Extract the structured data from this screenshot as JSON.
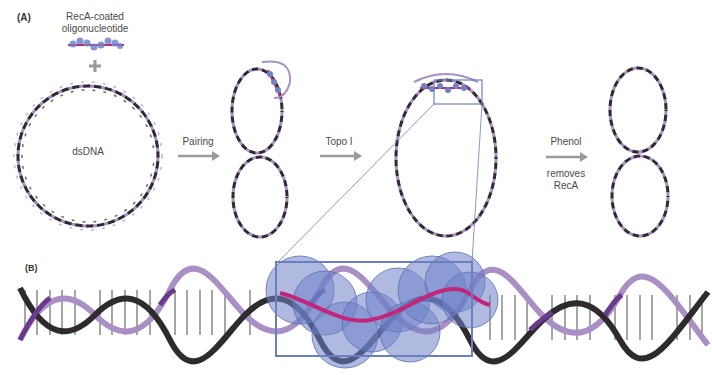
{
  "panel_a": {
    "label": "(A)",
    "oligo_label_line1": "RecA-coated",
    "oligo_label_line2": "oligonucleotide",
    "plus": "+",
    "dsdna_label": "dsDNA",
    "steps": [
      {
        "label": "Pairing"
      },
      {
        "label": "Topo I"
      },
      {
        "label_top": "Phenol",
        "label_bottom_line1": "removes",
        "label_bottom_line2": "RecA"
      }
    ]
  },
  "panel_b": {
    "label": "(B)"
  },
  "colors": {
    "strand_dark": "#2e2a2e",
    "strand_light": "#a98fc4",
    "strand_purple": "#6a3a8c",
    "oligo_magenta": "#c2267a",
    "reca_blue": "#6f82c8",
    "zoom_box": "#6a7fc0",
    "arrow_gray": "#9a9a9a",
    "rung_gray": "#a6a6a6"
  }
}
